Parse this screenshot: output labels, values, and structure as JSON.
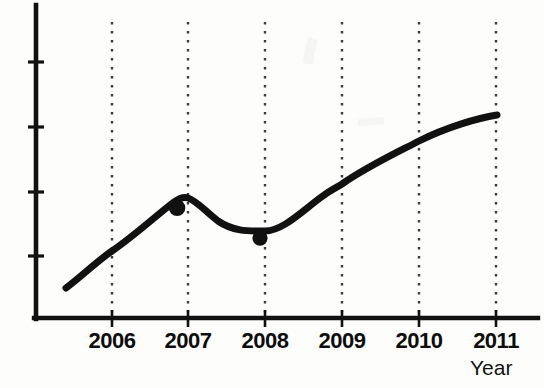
{
  "chart_data": {
    "type": "line",
    "title": "",
    "subtitle": "",
    "xlabel": "Year",
    "ylabel": "",
    "categories": [
      "2006",
      "2007",
      "2008",
      "2009",
      "2010",
      "2011"
    ],
    "x": [
      2006,
      2007,
      2008,
      2009,
      2010,
      2011
    ],
    "series": [
      {
        "name": "",
        "values": [
          1.05,
          1.86,
          1.35,
          2.55,
          3.45,
          4.05
        ]
      }
    ],
    "markers": [
      {
        "x": "2007",
        "y": 1.86,
        "label": ""
      },
      {
        "x": "2008",
        "y": 1.35,
        "label": ""
      }
    ],
    "xlim": [
      2005.3,
      2011.35
    ],
    "ylim": [
      0,
      5.0
    ],
    "y_ticks": [
      1.0,
      2.0,
      3.0,
      4.0
    ],
    "y_tick_labels": [
      "",
      "",
      "",
      ""
    ],
    "grid": true,
    "grid_style": "dotted-vertical",
    "legend": null,
    "legend_position": "none",
    "line_color": "#111111",
    "line_width": 7,
    "marker_color": "#111111",
    "marker_shape": "circle",
    "axis_color": "#111111",
    "grid_color": "#4a4a4a",
    "background_color": "#fdfdfc",
    "annotations": []
  },
  "axes": {
    "x_tick_labels": [
      {
        "text": "2006",
        "px": 112
      },
      {
        "text": "2007",
        "px": 188
      },
      {
        "text": "2008",
        "px": 265
      },
      {
        "text": "2009",
        "px": 342
      },
      {
        "text": "2010",
        "px": 419
      },
      {
        "text": "2011",
        "px": 496
      }
    ],
    "x_axis_title": "Year"
  }
}
